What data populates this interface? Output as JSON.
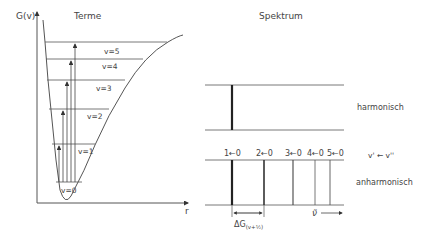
{
  "left_panel": {
    "title": "Terme",
    "y_axis_label": "G(v)",
    "x_axis_label": "r",
    "levels": [
      {
        "label": "v=0"
      },
      {
        "label": "v=1"
      },
      {
        "label": "v=2"
      },
      {
        "label": "v=3"
      },
      {
        "label": "v=4"
      },
      {
        "label": "v=5"
      }
    ]
  },
  "right_panel": {
    "title": "Spektrum",
    "harmonic_label": "harmonisch",
    "transition_label": "v' ← v''",
    "anharmonic_label": "anharmonisch",
    "transitions": [
      {
        "label": "1←0"
      },
      {
        "label": "2←0"
      },
      {
        "label": "3←0"
      },
      {
        "label": "4←0"
      },
      {
        "label": "5←0"
      }
    ],
    "spacing_label": "ΔG",
    "spacing_subscript": "(v+½)",
    "wavenumber_label": "ν̃"
  },
  "colors": {
    "line": "#555555",
    "text": "#444444"
  }
}
